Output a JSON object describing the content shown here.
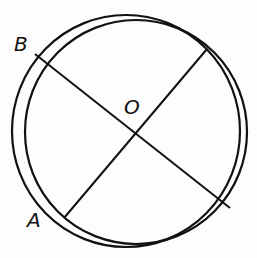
{
  "diagram": {
    "labels": {
      "B": "B",
      "O": "O",
      "A": "A"
    },
    "colors": {
      "stroke": "#111111",
      "background": "#fdfdfd"
    },
    "shapes": {
      "circle_1": {
        "cx": 127,
        "cy": 131,
        "r": 115
      },
      "circle_2": {
        "cx": 138,
        "cy": 133,
        "r": 111
      },
      "line_B": {
        "x1": 35,
        "y1": 54,
        "x2": 230,
        "y2": 208
      },
      "line_A": {
        "x1": 64,
        "y1": 218,
        "x2": 207,
        "y2": 49
      }
    }
  }
}
